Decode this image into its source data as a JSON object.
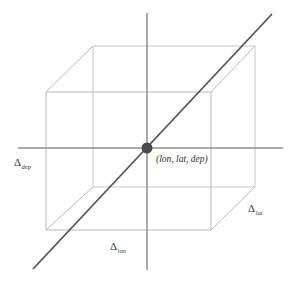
{
  "figure": {
    "kind": "3d-wireframe-cube-diagram",
    "background_color": "#ffffff",
    "width": 293,
    "height": 282
  },
  "colors": {
    "cube_edge": "#b9b9b9",
    "cube_edge_back": "#c6c6c6",
    "axis": "#8f8f8f",
    "diagonal": "#565656",
    "center_dot": "#4a4a4a",
    "label_text": "#3a3a3a",
    "point_label_text": "#2e2e2e"
  },
  "cube": {
    "front_face": {
      "top_left": [
        46,
        92
      ],
      "top_right": [
        211,
        92
      ],
      "bottom_right": [
        211,
        230
      ],
      "bottom_left": [
        46,
        230
      ]
    },
    "back_face": {
      "top_left": [
        93,
        46
      ],
      "top_right": [
        255,
        46
      ],
      "bottom_right": [
        255,
        187
      ],
      "bottom_left": [
        93,
        187
      ]
    }
  },
  "axes": {
    "horizontal": {
      "x1": 18,
      "y1": 148,
      "x2": 283,
      "y2": 148
    },
    "vertical": {
      "x1": 147,
      "y1": 13,
      "x2": 147,
      "y2": 270
    },
    "diagonal": {
      "x1": 33,
      "y1": 269,
      "x2": 272,
      "y2": 14
    }
  },
  "center_point": {
    "cx": 147,
    "cy": 148,
    "r": 5.5,
    "label": "(lon, lat, dep)",
    "label_x": 156,
    "label_y": 162
  },
  "labels": {
    "depth": {
      "symbol": "Δ",
      "subscript": "dep",
      "x": 14,
      "y": 166
    },
    "longitude": {
      "symbol": "Δ",
      "subscript": "lon",
      "x": 110,
      "y": 250
    },
    "latitude": {
      "symbol": "Δ",
      "subscript": "lat",
      "x": 248,
      "y": 212
    }
  }
}
